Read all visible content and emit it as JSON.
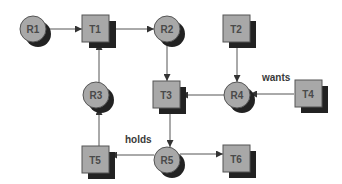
{
  "diagram": {
    "title": "",
    "colors": {
      "node_fill": "#a8a8a8",
      "node_stroke": "#555555",
      "shadow": "#222222",
      "edge": "#555555",
      "text": "#4a4a4a",
      "background": "#ffffff"
    },
    "nodes": [
      {
        "id": "R1",
        "label": "R1",
        "shape": "circle",
        "cx": 33,
        "cy": 29
      },
      {
        "id": "T1",
        "label": "T1",
        "shape": "square",
        "cx": 96,
        "cy": 29
      },
      {
        "id": "R2",
        "label": "R2",
        "shape": "circle",
        "cx": 167,
        "cy": 29
      },
      {
        "id": "T2",
        "label": "T2",
        "shape": "square",
        "cx": 237,
        "cy": 29
      },
      {
        "id": "R3",
        "label": "R3",
        "shape": "circle",
        "cx": 96,
        "cy": 95
      },
      {
        "id": "T3",
        "label": "T3",
        "shape": "square",
        "cx": 167,
        "cy": 95
      },
      {
        "id": "R4",
        "label": "R4",
        "shape": "circle",
        "cx": 237,
        "cy": 95
      },
      {
        "id": "T4",
        "label": "T4",
        "shape": "square",
        "cx": 308,
        "cy": 94
      },
      {
        "id": "T5",
        "label": "T5",
        "shape": "square",
        "cx": 96,
        "cy": 160
      },
      {
        "id": "R5",
        "label": "R5",
        "shape": "circle",
        "cx": 167,
        "cy": 160
      },
      {
        "id": "T6",
        "label": "T6",
        "shape": "square",
        "cx": 237,
        "cy": 158
      }
    ],
    "edges": [
      {
        "from": "R1",
        "to": "T1",
        "label": ""
      },
      {
        "from": "T1",
        "to": "R2",
        "label": ""
      },
      {
        "from": "R2",
        "to": "T3",
        "label": ""
      },
      {
        "from": "T2",
        "to": "R4",
        "label": ""
      },
      {
        "from": "R4",
        "to": "T3",
        "label": ""
      },
      {
        "from": "T4",
        "to": "R4",
        "label": "wants"
      },
      {
        "from": "R3",
        "to": "T1",
        "label": ""
      },
      {
        "from": "T5",
        "to": "R3",
        "label": ""
      },
      {
        "from": "T3",
        "to": "R5",
        "label": ""
      },
      {
        "from": "R5",
        "to": "T5",
        "label": "holds"
      },
      {
        "from": "R5",
        "to": "T6",
        "label": ""
      }
    ],
    "edge_labels": {
      "wants": "wants",
      "holds": "holds"
    }
  }
}
